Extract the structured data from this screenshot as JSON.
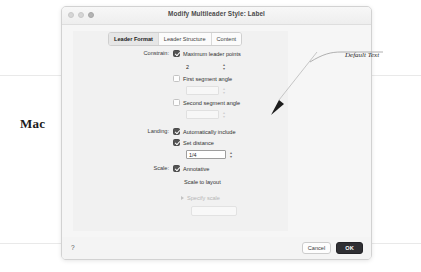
{
  "page": {
    "side_note": "Mac"
  },
  "window": {
    "title": "Modify Multileader Style: Label",
    "controls": {
      "close": "close-button",
      "minimize": "minimize-button",
      "zoom": "zoom-button"
    }
  },
  "tabs": [
    {
      "label": "Leader Format",
      "selected": true
    },
    {
      "label": "Leader Structure",
      "selected": false
    },
    {
      "label": "Content",
      "selected": false
    }
  ],
  "form": {
    "constraints": {
      "label": "Constrain:",
      "max_leader_points": {
        "label": "Maximum leader points",
        "checked": true,
        "value": "2"
      },
      "first_segment_angle": {
        "label": "First segment angle",
        "checked": false,
        "value": ""
      },
      "second_segment_angle": {
        "label": "Second segment angle",
        "checked": false,
        "value": ""
      }
    },
    "landing": {
      "label": "Landing:",
      "automatically_include": {
        "label": "Automatically include",
        "checked": true
      },
      "set_distance": {
        "label": "Set distance",
        "checked": true,
        "value": "1/4"
      }
    },
    "scale": {
      "label": "Scale:",
      "annotative": {
        "label": "Annotative",
        "checked": true
      },
      "scale_to_layout": {
        "label": "Scale to layout",
        "checked": false
      },
      "specify_scale": {
        "label": "Specify scale",
        "value": ""
      }
    }
  },
  "footer": {
    "help_label": "?",
    "cancel_label": "Cancel",
    "ok_label": "OK"
  },
  "annotation": {
    "text": "Default Text"
  },
  "colors": {
    "ok_button": "#2f2f33",
    "window_bg": "#f3f3f3",
    "panel_bg": "#f1f1f1",
    "checkbox_checked": "#545454"
  }
}
